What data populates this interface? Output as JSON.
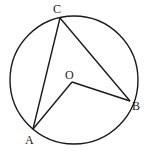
{
  "diagram": {
    "type": "circle-geometry",
    "circle": {
      "cx": 74,
      "cy": 80,
      "r": 64
    },
    "points": {
      "A": {
        "label": "A",
        "x": 33,
        "y": 129,
        "lx": 25,
        "ly": 144
      },
      "B": {
        "label": "B",
        "x": 130,
        "y": 101,
        "lx": 132,
        "ly": 110
      },
      "C": {
        "label": "C",
        "x": 60,
        "y": 18,
        "lx": 53,
        "ly": 13
      },
      "O": {
        "label": "O",
        "x": 72,
        "y": 82,
        "lx": 65,
        "ly": 79
      }
    },
    "segments": [
      [
        "A",
        "C"
      ],
      [
        "C",
        "B"
      ],
      [
        "A",
        "O"
      ],
      [
        "O",
        "B"
      ]
    ],
    "stroke_color": "#1a1a1a"
  }
}
